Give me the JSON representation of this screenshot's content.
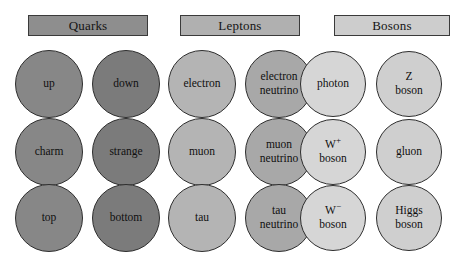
{
  "figure": {
    "width": 476,
    "height": 262,
    "background": "#ffffff"
  },
  "groups": [
    {
      "id": "quarks",
      "header": {
        "label": "Quarks",
        "x": 28,
        "y": 15,
        "width": 120,
        "height": 21,
        "fill": "#8e8e8e",
        "border": "#3a3a3a",
        "text_color": "#141414"
      },
      "columns": [
        {
          "id": "quarks-col-1",
          "center_x": 49,
          "radius": 34,
          "fill": "#878787"
        },
        {
          "id": "quarks-col-2",
          "center_x": 126,
          "radius": 34,
          "fill": "#7b7b7b"
        }
      ],
      "particles": [
        {
          "name": "up",
          "lines": [
            "up"
          ],
          "column": 0,
          "row": 0
        },
        {
          "name": "down",
          "lines": [
            "down"
          ],
          "column": 1,
          "row": 0
        },
        {
          "name": "charm",
          "lines": [
            "charm"
          ],
          "column": 0,
          "row": 1
        },
        {
          "name": "strange",
          "lines": [
            "strange"
          ],
          "column": 1,
          "row": 1
        },
        {
          "name": "top",
          "lines": [
            "top"
          ],
          "column": 0,
          "row": 2
        },
        {
          "name": "bottom",
          "lines": [
            "bottom"
          ],
          "column": 1,
          "row": 2
        }
      ]
    },
    {
      "id": "leptons",
      "header": {
        "label": "Leptons",
        "x": 180,
        "y": 15,
        "width": 120,
        "height": 21,
        "fill": "#b0b0b0",
        "border": "#3a3a3a",
        "text_color": "#141414"
      },
      "columns": [
        {
          "id": "leptons-col-1",
          "center_x": 202,
          "radius": 34,
          "fill": "#b4b4b4"
        },
        {
          "id": "leptons-col-2",
          "center_x": 279,
          "radius": 34,
          "fill": "#a8a8a8"
        }
      ],
      "particles": [
        {
          "name": "electron",
          "lines": [
            "electron"
          ],
          "column": 0,
          "row": 0
        },
        {
          "name": "electron-neutrino",
          "lines": [
            "electron",
            "neutrino"
          ],
          "column": 1,
          "row": 0
        },
        {
          "name": "muon",
          "lines": [
            "muon"
          ],
          "column": 0,
          "row": 1
        },
        {
          "name": "muon-neutrino",
          "lines": [
            "muon",
            "neutrino"
          ],
          "column": 1,
          "row": 1
        },
        {
          "name": "tau",
          "lines": [
            "tau"
          ],
          "column": 0,
          "row": 2
        },
        {
          "name": "tau-neutrino",
          "lines": [
            "tau",
            "neutrino"
          ],
          "column": 1,
          "row": 2
        }
      ]
    },
    {
      "id": "bosons",
      "header": {
        "label": "Bosons",
        "x": 334,
        "y": 15,
        "width": 116,
        "height": 21,
        "fill": "#cdcdcd",
        "border": "#3a3a3a",
        "text_color": "#141414"
      },
      "columns": [
        {
          "id": "bosons-col-1",
          "center_x": 333,
          "radius": 33,
          "fill": "#d6d6d6"
        },
        {
          "id": "bosons-col-2",
          "center_x": 409,
          "radius": 33,
          "fill": "#cfcfcf"
        }
      ],
      "particles": [
        {
          "name": "photon",
          "lines": [
            "photon"
          ],
          "column": 0,
          "row": 0
        },
        {
          "name": "z-boson",
          "lines": [
            "Z",
            "boson"
          ],
          "column": 1,
          "row": 0
        },
        {
          "name": "w-plus-boson",
          "lines": [
            "W<sup>+</sup>",
            "boson"
          ],
          "html": true,
          "column": 0,
          "row": 1
        },
        {
          "name": "gluon",
          "lines": [
            "gluon"
          ],
          "column": 1,
          "row": 1
        },
        {
          "name": "w-minus-boson",
          "lines": [
            "W<sup>−</sup>",
            "boson"
          ],
          "html": true,
          "column": 0,
          "row": 2
        },
        {
          "name": "higgs-boson",
          "lines": [
            "Higgs",
            "boson"
          ],
          "column": 1,
          "row": 2
        }
      ]
    }
  ],
  "rows": [
    {
      "index": 0,
      "center_y": 84
    },
    {
      "index": 1,
      "center_y": 152
    },
    {
      "index": 2,
      "center_y": 218
    }
  ]
}
